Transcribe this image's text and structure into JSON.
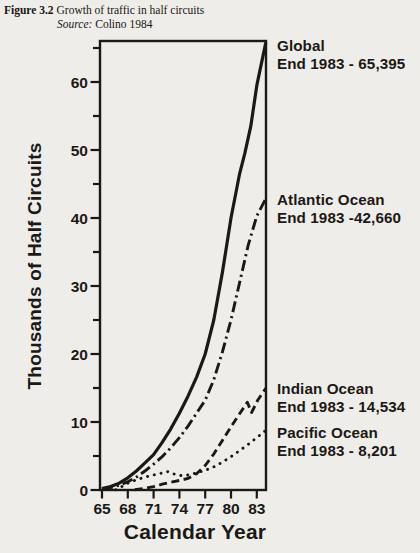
{
  "figure": {
    "number": "Figure 3.2",
    "title": "Growth of traffic in half circuits",
    "source_label": "Source:",
    "source": "Colino 1984"
  },
  "chart_data": {
    "type": "line",
    "title": "Growth of traffic in half circuits",
    "xlabel": "Calendar Year",
    "ylabel": "Thousands of Half Circuits",
    "x_ticks": [
      65,
      68,
      71,
      74,
      77,
      80,
      83
    ],
    "y_ticks": [
      0,
      10,
      20,
      30,
      40,
      50,
      60
    ],
    "y_minor_ticks": [
      5,
      15,
      25,
      35,
      45,
      55,
      65
    ],
    "x_range": [
      64.8,
      84.1
    ],
    "y_range": [
      0,
      66
    ],
    "grid": false,
    "legend_position": "right-annotations",
    "ink_color": "#1b1916",
    "background_color": "#efede9",
    "series": [
      {
        "name": "Global",
        "label": "Global",
        "end_label": "End 1983 - 65,395",
        "end_1983_value": 65395,
        "line_style": "solid",
        "points": [
          [
            65,
            0.2
          ],
          [
            66,
            0.5
          ],
          [
            67,
            1.0
          ],
          [
            68,
            1.8
          ],
          [
            69,
            2.8
          ],
          [
            70,
            4.0
          ],
          [
            71,
            5.2
          ],
          [
            72,
            7.0
          ],
          [
            73,
            9.0
          ],
          [
            74,
            11.3
          ],
          [
            75,
            13.8
          ],
          [
            76,
            16.6
          ],
          [
            77,
            20.0
          ],
          [
            78,
            25.0
          ],
          [
            79,
            32.0
          ],
          [
            80,
            40.0
          ],
          [
            81,
            46.5
          ],
          [
            81.6,
            49.5
          ],
          [
            82.3,
            53.5
          ],
          [
            83,
            59.5
          ],
          [
            84.05,
            65.8
          ]
        ]
      },
      {
        "name": "Atlantic Ocean",
        "label": "Atlantic Ocean",
        "end_label": "End 1983 -42,660",
        "end_1983_value": 42660,
        "line_style": "dash-dot",
        "points": [
          [
            65,
            0.15
          ],
          [
            66,
            0.35
          ],
          [
            67,
            0.7
          ],
          [
            68,
            1.2
          ],
          [
            69,
            1.9
          ],
          [
            70,
            2.8
          ],
          [
            71,
            3.8
          ],
          [
            72,
            4.9
          ],
          [
            73,
            6.2
          ],
          [
            74,
            7.7
          ],
          [
            75,
            9.4
          ],
          [
            76,
            11.3
          ],
          [
            77,
            13.2
          ],
          [
            78,
            16.2
          ],
          [
            79,
            20.3
          ],
          [
            80,
            25.0
          ],
          [
            81,
            30.5
          ],
          [
            82,
            36.0
          ],
          [
            83,
            40.3
          ],
          [
            84.07,
            42.9
          ]
        ]
      },
      {
        "name": "Indian Ocean",
        "label": "Indian Ocean",
        "end_label": "End 1983 - 14,534",
        "end_1983_value": 14534,
        "line_style": "dashed",
        "points": [
          [
            68.8,
            0.05
          ],
          [
            70,
            0.25
          ],
          [
            71,
            0.5
          ],
          [
            72,
            0.85
          ],
          [
            73,
            1.15
          ],
          [
            74,
            1.4
          ],
          [
            75,
            1.7
          ],
          [
            76,
            2.4
          ],
          [
            77,
            3.6
          ],
          [
            78,
            5.3
          ],
          [
            79,
            7.3
          ],
          [
            80,
            9.3
          ],
          [
            81,
            11.2
          ],
          [
            81.9,
            12.9
          ],
          [
            82.4,
            11.4
          ],
          [
            83.1,
            13.2
          ],
          [
            84.07,
            15.0
          ]
        ]
      },
      {
        "name": "Pacific Ocean",
        "label": "Pacific Ocean",
        "end_label": "End 1983 - 8,201",
        "end_1983_value": 8201,
        "line_style": "dotted",
        "points": [
          [
            66.6,
            0.05
          ],
          [
            67,
            0.3
          ],
          [
            68,
            1.0
          ],
          [
            69,
            1.5
          ],
          [
            70,
            1.9
          ],
          [
            71,
            2.2
          ],
          [
            72,
            2.5
          ],
          [
            72.7,
            2.7
          ],
          [
            73.5,
            2.3
          ],
          [
            74.3,
            2.1
          ],
          [
            75,
            2.2
          ],
          [
            76,
            2.5
          ],
          [
            77,
            2.9
          ],
          [
            78,
            3.4
          ],
          [
            79,
            4.1
          ],
          [
            80,
            4.9
          ],
          [
            81,
            5.8
          ],
          [
            82,
            6.7
          ],
          [
            83,
            7.7
          ],
          [
            84.07,
            8.8
          ]
        ]
      }
    ]
  }
}
